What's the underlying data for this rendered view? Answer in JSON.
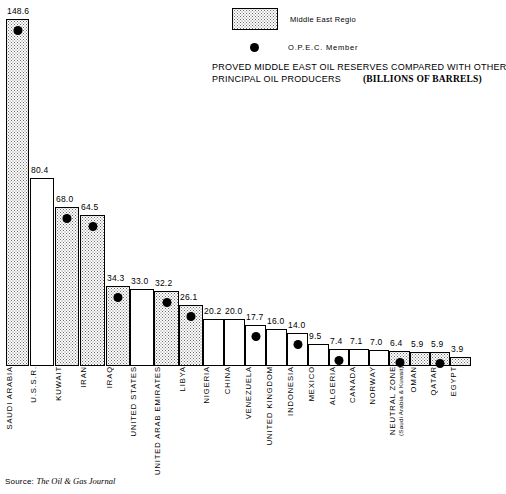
{
  "legend": {
    "region_label": "Middle East Regio",
    "opec_label": "O.P.E.C. Member",
    "region_swatch_name": "stipple-swatch",
    "opec_marker_name": "opec-dot-marker"
  },
  "title": {
    "line1": "PROVED MIDDLE EAST OIL RESERVES COMPARED WITH OTHER",
    "line2": "PRINCIPAL OIL PRODUCERS",
    "units": "(BILLIONS OF BARRELS)"
  },
  "source": {
    "prefix": "Source:",
    "journal": "The Oil & Gas Journal"
  },
  "chart_data": {
    "type": "bar",
    "xlabel": "",
    "ylabel": "Billions of Barrels",
    "ylim": [
      0,
      148.6
    ],
    "grid": false,
    "legend_position": "top-right",
    "categories": [
      "SAUDI ARABIA",
      "U.S.S.R.",
      "KUWAIT",
      "IRAN",
      "IRAQ",
      "UNITED STATES",
      "UNITED ARAB EMIRATES",
      "LIBYA",
      "NIGERIA",
      "CHINA",
      "VENEZUELA",
      "UNITED KINGDOM",
      "INDONESIA",
      "MEXICO",
      "ALGERIA",
      "CANADA",
      "NORWAY",
      "NEUTRAL ZONE",
      "OMAN",
      "QATAR",
      "EGYPT"
    ],
    "values": [
      148.6,
      80.4,
      68.0,
      64.5,
      34.3,
      33.0,
      32.2,
      26.1,
      20.2,
      20.0,
      17.7,
      16.0,
      14.0,
      9.5,
      7.4,
      7.1,
      7.0,
      6.4,
      5.9,
      5.9,
      3.9
    ],
    "bars": [
      {
        "label": "SAUDI ARABIA",
        "sub": "",
        "value": 148.6,
        "value_text": "148.6",
        "middle_east": true,
        "opec": true
      },
      {
        "label": "U.S.S.R.",
        "sub": "",
        "value": 80.4,
        "value_text": "80.4",
        "middle_east": false,
        "opec": false
      },
      {
        "label": "KUWAIT",
        "sub": "",
        "value": 68.0,
        "value_text": "68.0",
        "middle_east": true,
        "opec": true
      },
      {
        "label": "IRAN",
        "sub": "",
        "value": 64.5,
        "value_text": "64.5",
        "middle_east": true,
        "opec": true
      },
      {
        "label": "IRAQ",
        "sub": "",
        "value": 34.3,
        "value_text": "34.3",
        "middle_east": true,
        "opec": true
      },
      {
        "label": "UNITED STATES",
        "sub": "",
        "value": 33.0,
        "value_text": "33.0",
        "middle_east": false,
        "opec": false
      },
      {
        "label": "UNITED ARAB EMIRATES",
        "sub": "",
        "value": 32.2,
        "value_text": "32.2",
        "middle_east": true,
        "opec": true
      },
      {
        "label": "LIBYA",
        "sub": "",
        "value": 26.1,
        "value_text": "26.1",
        "middle_east": true,
        "opec": true
      },
      {
        "label": "NIGERIA",
        "sub": "",
        "value": 20.2,
        "value_text": "20.2",
        "middle_east": false,
        "opec": false
      },
      {
        "label": "CHINA",
        "sub": "",
        "value": 20.0,
        "value_text": "20.0",
        "middle_east": false,
        "opec": false
      },
      {
        "label": "VENEZUELA",
        "sub": "",
        "value": 17.7,
        "value_text": "17.7",
        "middle_east": false,
        "opec": true
      },
      {
        "label": "UNITED KINGDOM",
        "sub": "",
        "value": 16.0,
        "value_text": "16.0",
        "middle_east": false,
        "opec": false
      },
      {
        "label": "INDONESIA",
        "sub": "",
        "value": 14.0,
        "value_text": "14.0",
        "middle_east": false,
        "opec": true
      },
      {
        "label": "MEXICO",
        "sub": "",
        "value": 9.5,
        "value_text": "9.5",
        "middle_east": false,
        "opec": false
      },
      {
        "label": "ALGERIA",
        "sub": "",
        "value": 7.4,
        "value_text": "7.4",
        "middle_east": false,
        "opec": true
      },
      {
        "label": "CANADA",
        "sub": "",
        "value": 7.1,
        "value_text": "7.1",
        "middle_east": false,
        "opec": false
      },
      {
        "label": "NORWAY",
        "sub": "",
        "value": 7.0,
        "value_text": "7.0",
        "middle_east": false,
        "opec": false
      },
      {
        "label": "NEUTRAL ZONE",
        "sub": "(Saudi Arabia & Kuwait)",
        "value": 6.4,
        "value_text": "6.4",
        "middle_east": true,
        "opec": true
      },
      {
        "label": "OMAN",
        "sub": "",
        "value": 5.9,
        "value_text": "5.9",
        "middle_east": true,
        "opec": false
      },
      {
        "label": "QATAR",
        "sub": "",
        "value": 5.9,
        "value_text": "5.9",
        "middle_east": true,
        "opec": true
      },
      {
        "label": "EGYPT",
        "sub": "",
        "value": 3.9,
        "value_text": "3.9",
        "middle_east": true,
        "opec": false
      }
    ]
  }
}
